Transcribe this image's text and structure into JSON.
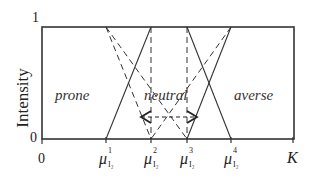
{
  "diagram": {
    "y_axis": {
      "title": "Intensity",
      "top_tick": "1",
      "bottom_tick": "0"
    },
    "x_axis": {
      "origin": "0",
      "ticks": [
        {
          "symbol": "μ",
          "sup": "1",
          "sub": "I₂"
        },
        {
          "symbol": "μ",
          "sup": "2",
          "sub": "I₂"
        },
        {
          "symbol": "μ",
          "sup": "3",
          "sub": "I₂"
        },
        {
          "symbol": "μ",
          "sup": "4",
          "sub": "I₂"
        }
      ],
      "end_label": "K"
    },
    "regions": {
      "left": "prone",
      "middle": "neutral",
      "right": "averse"
    },
    "colors": {
      "line": "#333333",
      "frame": "#333333",
      "background": "#ffffff"
    }
  }
}
